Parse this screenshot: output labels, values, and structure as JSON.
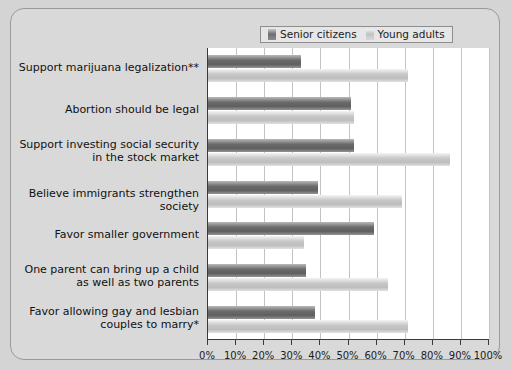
{
  "chart_data": {
    "type": "bar",
    "orientation": "horizontal",
    "title": "",
    "subtitle": "",
    "xlabel": "",
    "ylabel": "",
    "xlim": [
      0,
      100
    ],
    "grid": true,
    "legend_position": "top-right",
    "xticks": [
      "0%",
      "10%",
      "20%",
      "30%",
      "40%",
      "50%",
      "60%",
      "70%",
      "80%",
      "90%",
      "100%"
    ],
    "xtick_values": [
      0,
      10,
      20,
      30,
      40,
      50,
      60,
      70,
      80,
      90,
      100
    ],
    "categories": [
      "Support marijuana legalization**",
      "Abortion should be legal",
      "Support investing social security\nin the stock market",
      "Believe immigrants strengthen society",
      "Favor smaller government",
      "One parent can bring up a child\nas well as two parents",
      "Favor allowing gay and lesbian\ncouples to marry*"
    ],
    "series": [
      {
        "name": "Senior citizens",
        "color": "#6b6b6b",
        "values": [
          33,
          51,
          52,
          39,
          59,
          35,
          38
        ]
      },
      {
        "name": "Young adults",
        "color": "#c8c8c8",
        "values": [
          71,
          52,
          86,
          69,
          34,
          64,
          71
        ]
      }
    ]
  },
  "legend": {
    "items": [
      {
        "label": "Senior citizens",
        "swatch": "senior"
      },
      {
        "label": "Young adults",
        "swatch": "young"
      }
    ]
  }
}
